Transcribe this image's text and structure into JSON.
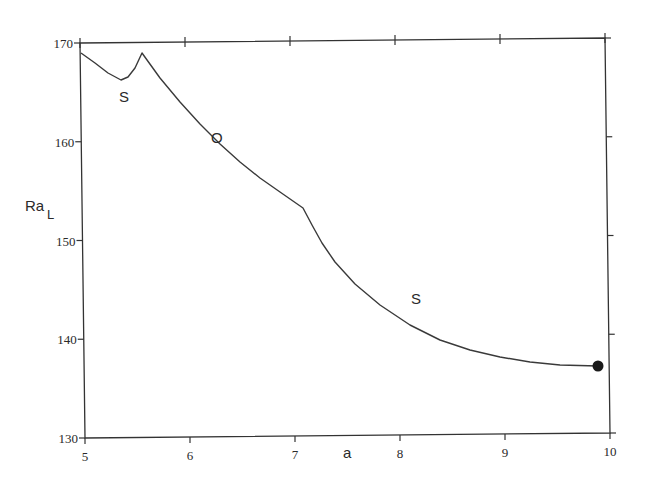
{
  "chart_data": {
    "type": "line",
    "title": "",
    "xlabel": "a",
    "ylabel": "Ra",
    "ylabel_subscript": "L",
    "xlim": [
      5,
      10
    ],
    "ylim": [
      130,
      170
    ],
    "x_ticks": [
      5,
      6,
      7,
      8,
      9,
      10
    ],
    "y_ticks": [
      130,
      140,
      150,
      160,
      170
    ],
    "grid": false,
    "legend": null,
    "series": [
      {
        "name": "Ra_L(a)",
        "x": [
          5.0,
          5.13,
          5.26,
          5.38,
          5.45,
          5.51,
          5.58,
          5.75,
          5.94,
          6.13,
          6.32,
          6.51,
          6.7,
          6.89,
          7.1,
          7.19,
          7.29,
          7.41,
          7.6,
          7.84,
          8.13,
          8.42,
          8.7,
          8.99,
          9.27,
          9.56,
          9.9
        ],
        "y": [
          169.0,
          168.0,
          167.0,
          166.3,
          166.6,
          167.5,
          169.0,
          166.5,
          164.1,
          161.9,
          159.9,
          158.1,
          156.5,
          155.1,
          153.5,
          151.8,
          150.0,
          148.1,
          145.8,
          143.7,
          141.7,
          140.2,
          139.2,
          138.5,
          138.0,
          137.7,
          137.3
        ]
      }
    ],
    "annotations": [
      {
        "text": "S",
        "x": 5.4,
        "y": 165.2
      },
      {
        "text": "O",
        "x": 6.27,
        "y": 159.7
      },
      {
        "text": "S",
        "x": 8.17,
        "y": 143.6
      }
    ],
    "markers": [
      {
        "shape": "filled-circle",
        "x": 9.9,
        "y": 137.3
      }
    ]
  },
  "frame": {
    "corners_px": {
      "tl": [
        80,
        43
      ],
      "bl": [
        85,
        438
      ],
      "br": [
        610,
        433
      ],
      "tr": [
        605,
        38
      ]
    }
  },
  "curve_px": [
    [
      81,
      53
    ],
    [
      95,
      63
    ],
    [
      108,
      73
    ],
    [
      121,
      80
    ],
    [
      128,
      77
    ],
    [
      135,
      68
    ],
    [
      142,
      53
    ],
    [
      160,
      78
    ],
    [
      180,
      102
    ],
    [
      200,
      124
    ],
    [
      220,
      144
    ],
    [
      240,
      162
    ],
    [
      260,
      178
    ],
    [
      280,
      192
    ],
    [
      303,
      208
    ],
    [
      312,
      225
    ],
    [
      322,
      243
    ],
    [
      335,
      262
    ],
    [
      355,
      284
    ],
    [
      380,
      305
    ],
    [
      410,
      325
    ],
    [
      440,
      340
    ],
    [
      470,
      350
    ],
    [
      500,
      357
    ],
    [
      530,
      362
    ],
    [
      560,
      365
    ],
    [
      598,
      366
    ]
  ]
}
